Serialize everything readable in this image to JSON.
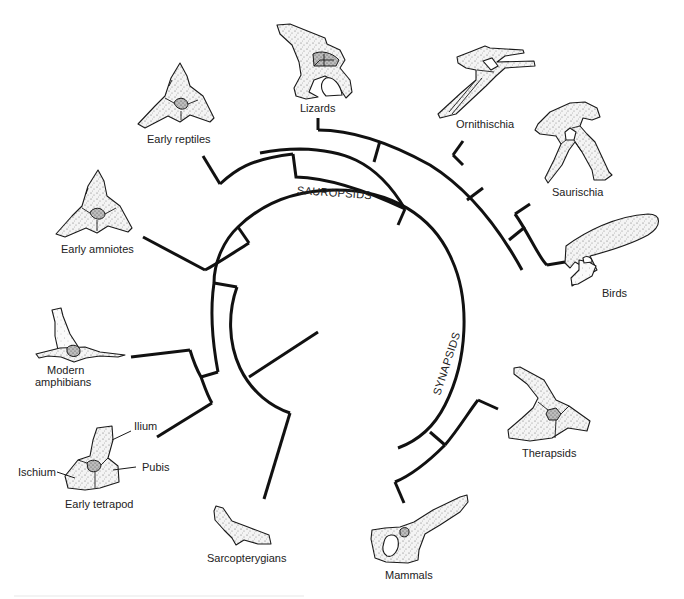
{
  "figure": {
    "type": "cladogram",
    "colors": {
      "line": "#111111",
      "text": "#222222",
      "background": "#ffffff"
    }
  },
  "clades": {
    "sauropsids": "SAUROPSIDS",
    "synapsids": "SYNAPSIDS"
  },
  "taxa": {
    "lizards": "Lizards",
    "ornithischia": "Ornithischia",
    "saurischia": "Saurischia",
    "birds": "Birds",
    "early_reptiles": "Early reptiles",
    "early_amniotes": "Early amniotes",
    "modern_amphibians_line1": "Modern",
    "modern_amphibians_line2": "amphibians",
    "early_tetrapod": "Early tetrapod",
    "sarcopterygians": "Sarcopterygians",
    "therapsids": "Therapsids",
    "mammals": "Mammals"
  },
  "bone_parts": {
    "ilium": "Ilium",
    "pubis": "Pubis",
    "ischium": "Ischium"
  }
}
